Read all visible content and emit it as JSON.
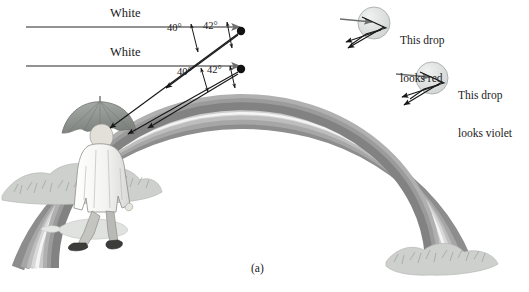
{
  "figure": {
    "caption": "(a)"
  },
  "incident_rays": [
    {
      "id": "upper",
      "label": "White"
    },
    {
      "id": "lower",
      "label": "White"
    }
  ],
  "angle_labels": {
    "upper": {
      "violet": "40°",
      "red": "42°"
    },
    "lower": {
      "violet": "40°",
      "red": "42°"
    }
  },
  "drop_callouts": [
    {
      "id": "red-drop",
      "line1": "This drop",
      "line2": "looks red"
    },
    {
      "id": "violet-drop",
      "line1": "This drop",
      "line2": "looks violet"
    }
  ],
  "rainbow_bands": [
    {
      "name": "outer-dark-red",
      "color": "#8d8d8d"
    },
    {
      "name": "red",
      "color": "#a3a3a3"
    },
    {
      "name": "orange",
      "color": "#b8b8b8"
    },
    {
      "name": "yellow",
      "color": "#d5d5d5"
    },
    {
      "name": "white-highlight",
      "color": "#f2f2f2"
    },
    {
      "name": "green",
      "color": "#c9c9c9"
    },
    {
      "name": "blue",
      "color": "#adadad"
    },
    {
      "name": "indigo",
      "color": "#999999"
    },
    {
      "name": "violet",
      "color": "#7f7f7f"
    }
  ],
  "colors": {
    "ink": "#1a1a1a",
    "ray_gray": "#6e6e6e",
    "ground": "#d9dbd8",
    "coat": "#f2f2f0",
    "umbrella": "#8f9490",
    "drop_fill": "#dfe2e0",
    "bush": "#c7cac6"
  },
  "scene": {
    "observer": "person-with-umbrella",
    "ground_left": "bushes-and-puddle",
    "ground_right": "bushes"
  }
}
